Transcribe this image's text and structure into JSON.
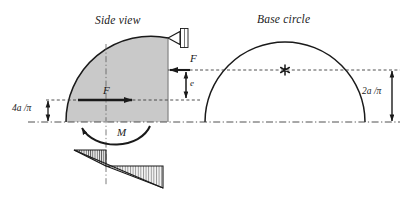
{
  "figure": {
    "background_color": "#ffffff",
    "line_color": "#1a1a1a",
    "fill_color": "#c9c9c9",
    "panels": {
      "side_view": {
        "title": "Side view"
      },
      "base_circle": {
        "title": "Base circle"
      }
    },
    "labels": {
      "force_upper": "F",
      "force_lower": "F",
      "eccentricity": "e",
      "moment": "M",
      "centroid_distance": "4a /π",
      "radius_distance": "2a /π"
    },
    "markers": {
      "center_marker": "asterisk-marker",
      "support": "pin-support"
    }
  }
}
